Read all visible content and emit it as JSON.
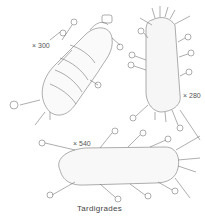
{
  "figure": {
    "caption": "Tardigrades",
    "specimens": [
      {
        "name": "tardigrade-dorsal-segmented",
        "magnification": "× 300"
      },
      {
        "name": "tardigrade-elongated-spiny",
        "magnification": "× 280"
      },
      {
        "name": "tardigrade-lateral-oval",
        "magnification": "× 540"
      }
    ]
  }
}
